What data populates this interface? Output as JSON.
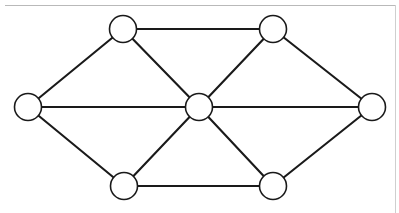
{
  "figure": {
    "width": 399,
    "height": 213,
    "background_color": "#ffffff"
  },
  "style": {
    "node_fill": "#ffffff",
    "node_stroke": "#1a1a1a",
    "node_stroke_width": 1.6,
    "node_radius": 13.5,
    "edge_color": "#1a1a1a",
    "edge_width": 2.1,
    "rule_color": "#b9b9b9"
  },
  "rules": [
    {
      "name": "top-rule",
      "x1": 5,
      "y1": 5.5,
      "x2": 396,
      "y2": 5.5,
      "color": "#b9b9b9"
    },
    {
      "name": "right-rule",
      "x1": 395.5,
      "y1": 5,
      "x2": 395.5,
      "y2": 213,
      "color": "#cfcfcf"
    }
  ],
  "chart_data": {
    "type": "diagram",
    "node_count": 7,
    "edge_count": 12,
    "nodes": [
      {
        "id": "left",
        "label": "",
        "x": 28,
        "y": 107,
        "r": 13.5,
        "degree": 3
      },
      {
        "id": "top-left",
        "label": "",
        "x": 123,
        "y": 29,
        "r": 13.5,
        "degree": 3
      },
      {
        "id": "top-right",
        "label": "",
        "x": 273,
        "y": 29,
        "r": 13.5,
        "degree": 3
      },
      {
        "id": "center",
        "label": "",
        "x": 199,
        "y": 107,
        "r": 13.5,
        "degree": 6
      },
      {
        "id": "right",
        "label": "",
        "x": 372,
        "y": 107,
        "r": 13.5,
        "degree": 3
      },
      {
        "id": "bottom-left",
        "label": "",
        "x": 124,
        "y": 186,
        "r": 13.5,
        "degree": 3
      },
      {
        "id": "bottom-right",
        "label": "",
        "x": 273,
        "y": 186,
        "r": 13.5,
        "degree": 3
      }
    ],
    "edges": [
      {
        "source": "left",
        "target": "top-left"
      },
      {
        "source": "left",
        "target": "center"
      },
      {
        "source": "left",
        "target": "bottom-left"
      },
      {
        "source": "top-left",
        "target": "top-right"
      },
      {
        "source": "top-left",
        "target": "center"
      },
      {
        "source": "top-right",
        "target": "center"
      },
      {
        "source": "top-right",
        "target": "right"
      },
      {
        "source": "center",
        "target": "right"
      },
      {
        "source": "center",
        "target": "bottom-left"
      },
      {
        "source": "center",
        "target": "bottom-right"
      },
      {
        "source": "bottom-left",
        "target": "bottom-right"
      },
      {
        "source": "bottom-right",
        "target": "right"
      }
    ]
  }
}
